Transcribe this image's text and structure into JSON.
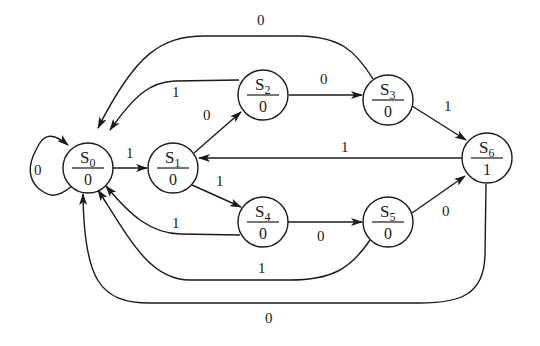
{
  "diagram": {
    "type": "moore-state-machine",
    "nodes": [
      {
        "id": "S0",
        "name": "S",
        "sub": "0",
        "output": "0",
        "x": 88,
        "y": 168
      },
      {
        "id": "S1",
        "name": "S",
        "sub": "1",
        "output": "0",
        "x": 173,
        "y": 168
      },
      {
        "id": "S2",
        "name": "S",
        "sub": "2",
        "output": "0",
        "x": 263,
        "y": 95
      },
      {
        "id": "S3",
        "name": "S",
        "sub": "3",
        "output": "0",
        "x": 388,
        "y": 100
      },
      {
        "id": "S4",
        "name": "S",
        "sub": "4",
        "output": "0",
        "x": 263,
        "y": 222
      },
      {
        "id": "S5",
        "name": "S",
        "sub": "5",
        "output": "0",
        "x": 388,
        "y": 222
      },
      {
        "id": "S6",
        "name": "S",
        "sub": "6",
        "output": "1",
        "x": 487,
        "y": 158
      }
    ],
    "edges": [
      {
        "from": "S0",
        "to": "S0",
        "label": "0"
      },
      {
        "from": "S0",
        "to": "S1",
        "label": "1"
      },
      {
        "from": "S1",
        "to": "S2",
        "label": "0"
      },
      {
        "from": "S1",
        "to": "S4",
        "label": "1"
      },
      {
        "from": "S2",
        "to": "S3",
        "label": "0"
      },
      {
        "from": "S2",
        "to": "S0",
        "label": "1"
      },
      {
        "from": "S3",
        "to": "S0",
        "label": "0"
      },
      {
        "from": "S3",
        "to": "S6",
        "label": "1"
      },
      {
        "from": "S4",
        "to": "S5",
        "label": "0"
      },
      {
        "from": "S4",
        "to": "S0",
        "label": "1"
      },
      {
        "from": "S5",
        "to": "S6",
        "label": "0"
      },
      {
        "from": "S5",
        "to": "S0",
        "label": "1"
      },
      {
        "from": "S6",
        "to": "S1",
        "label": "1"
      },
      {
        "from": "S6",
        "to": "S0",
        "label": "0"
      }
    ]
  }
}
